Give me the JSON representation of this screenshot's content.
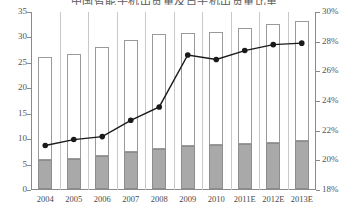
{
  "title": {
    "text": "中国智能手机出货量及占手机出货量比重",
    "clipped": true
  },
  "axes": {
    "left": {
      "ticks": [
        "0",
        "5",
        "10",
        "15",
        "20",
        "25",
        "30",
        "35"
      ],
      "min": 0,
      "max": 35
    },
    "right": {
      "ticks": [
        "18%",
        "20%",
        "22%",
        "24%",
        "26%",
        "28%",
        "30%"
      ],
      "min": 18,
      "max": 30
    }
  },
  "colors": {
    "bar_bottom": "#a9a9a9",
    "bar_top": "#ffffff",
    "bar_outline": "#9a9a9a",
    "line": "#1a1a1a",
    "axis": "#8a8a8a",
    "gridline": "#c9c9c9"
  },
  "chart_data": {
    "type": "bar",
    "title": "中国智能手机出货量及占手机出货量比重",
    "xlabel": "",
    "ylabel": "",
    "ylim": [
      0,
      35
    ],
    "y2lim": [
      18,
      30
    ],
    "grid": false,
    "legend": "none",
    "categories": [
      "2004",
      "2005",
      "2006",
      "2007",
      "2008",
      "2009",
      "2010",
      "2011E",
      "2012E",
      "2013E"
    ],
    "series": [
      {
        "name": "bar-bottom-segment",
        "type": "bar-stacked",
        "axis": "left",
        "values": [
          5.7,
          6.0,
          6.4,
          7.2,
          7.8,
          8.4,
          8.6,
          8.8,
          9.1,
          9.5
        ]
      },
      {
        "name": "bar-top-segment",
        "type": "bar-stacked",
        "axis": "left",
        "values": [
          20.3,
          20.6,
          21.6,
          22.1,
          22.6,
          22.3,
          22.2,
          22.9,
          23.4,
          23.5
        ]
      },
      {
        "name": "bar-total",
        "type": "bar-total",
        "axis": "left",
        "values": [
          26.0,
          26.6,
          28.0,
          29.3,
          30.4,
          30.7,
          30.8,
          31.7,
          32.5,
          33.0
        ]
      },
      {
        "name": "percentage-line",
        "type": "line",
        "axis": "right",
        "values": [
          21.0,
          21.4,
          21.6,
          22.7,
          23.6,
          27.1,
          26.8,
          27.4,
          27.8,
          27.9
        ]
      }
    ]
  }
}
